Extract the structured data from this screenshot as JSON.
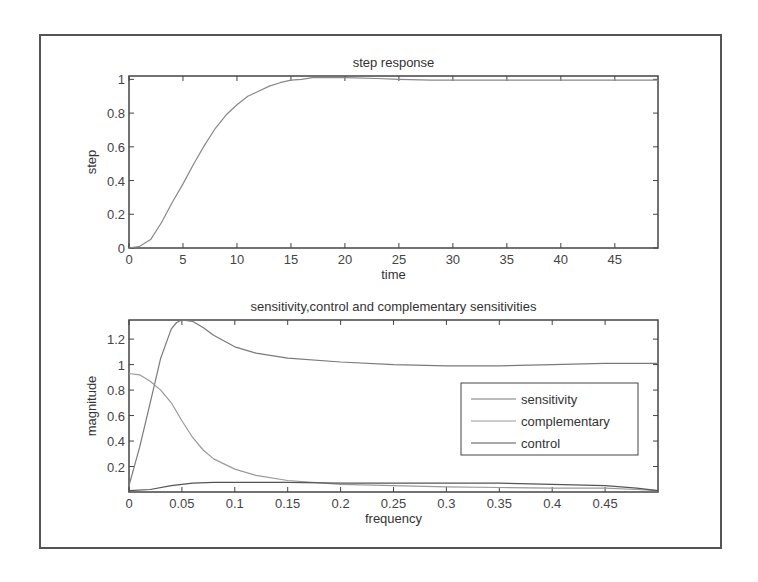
{
  "chart_data": [
    {
      "type": "line",
      "title": "step response",
      "xlabel": "time",
      "ylabel": "step",
      "xlim": [
        0,
        49
      ],
      "ylim": [
        0,
        1.02
      ],
      "xticks": [
        0,
        5,
        10,
        15,
        20,
        25,
        30,
        35,
        40,
        45
      ],
      "xtick_labels": [
        "0",
        "5",
        "10",
        "15",
        "20",
        "25",
        "30",
        "35",
        "40",
        "45"
      ],
      "yticks": [
        0,
        0.2,
        0.4,
        0.6,
        0.8,
        1
      ],
      "ytick_labels": [
        "0",
        "0.2",
        "0.4",
        "0.6",
        "0.8",
        "1"
      ],
      "grid": false,
      "series": [
        {
          "name": "step",
          "x": [
            0,
            1,
            2,
            3,
            4,
            5,
            6,
            7,
            8,
            9,
            10,
            11,
            12,
            13,
            14,
            15,
            16,
            17,
            20,
            23,
            25,
            28,
            30,
            35,
            40,
            45,
            49
          ],
          "y": [
            0,
            0.01,
            0.05,
            0.15,
            0.27,
            0.38,
            0.5,
            0.61,
            0.71,
            0.79,
            0.85,
            0.9,
            0.93,
            0.96,
            0.98,
            0.995,
            1.0,
            1.01,
            1.01,
            1.005,
            1.0,
            0.995,
            0.995,
            0.995,
            0.995,
            0.995,
            0.995
          ]
        }
      ]
    },
    {
      "type": "line",
      "title": "sensitivity,control and complementary sensitivities",
      "xlabel": "frequency",
      "ylabel": "magnitude",
      "xlim": [
        0,
        0.5
      ],
      "ylim": [
        0,
        1.35
      ],
      "xticks": [
        0,
        0.05,
        0.1,
        0.15,
        0.2,
        0.25,
        0.3,
        0.35,
        0.4,
        0.45
      ],
      "xtick_labels": [
        "0",
        "0.05",
        "0.1",
        "0.15",
        "0.2",
        "0.25",
        "0.3",
        "0.35",
        "0.4",
        "0.45"
      ],
      "yticks": [
        0.2,
        0.4,
        0.6,
        0.8,
        1,
        1.2
      ],
      "ytick_labels": [
        "0.2",
        "0.4",
        "0.6",
        "0.8",
        "1",
        "1.2"
      ],
      "grid": false,
      "legend_position": "right-center",
      "series": [
        {
          "name": "sensitivity",
          "x": [
            0,
            0.01,
            0.02,
            0.03,
            0.04,
            0.045,
            0.05,
            0.06,
            0.07,
            0.08,
            0.1,
            0.12,
            0.15,
            0.2,
            0.25,
            0.3,
            0.35,
            0.4,
            0.45,
            0.5
          ],
          "y": [
            0.05,
            0.35,
            0.7,
            1.05,
            1.28,
            1.33,
            1.35,
            1.34,
            1.29,
            1.23,
            1.14,
            1.09,
            1.05,
            1.02,
            1.0,
            0.99,
            0.99,
            1.0,
            1.01,
            1.01
          ]
        },
        {
          "name": "complementary",
          "x": [
            0,
            0.01,
            0.02,
            0.03,
            0.04,
            0.05,
            0.06,
            0.07,
            0.08,
            0.1,
            0.12,
            0.15,
            0.2,
            0.25,
            0.3,
            0.35,
            0.4,
            0.45,
            0.48,
            0.5
          ],
          "y": [
            0.93,
            0.92,
            0.87,
            0.8,
            0.7,
            0.56,
            0.43,
            0.33,
            0.26,
            0.18,
            0.13,
            0.09,
            0.06,
            0.05,
            0.04,
            0.035,
            0.03,
            0.03,
            0.02,
            0.01
          ]
        },
        {
          "name": "control",
          "x": [
            0,
            0.02,
            0.04,
            0.06,
            0.08,
            0.1,
            0.15,
            0.2,
            0.25,
            0.3,
            0.35,
            0.4,
            0.45,
            0.48,
            0.5
          ],
          "y": [
            0.01,
            0.02,
            0.05,
            0.07,
            0.075,
            0.075,
            0.075,
            0.07,
            0.07,
            0.07,
            0.07,
            0.06,
            0.05,
            0.03,
            0.01
          ]
        }
      ]
    }
  ]
}
